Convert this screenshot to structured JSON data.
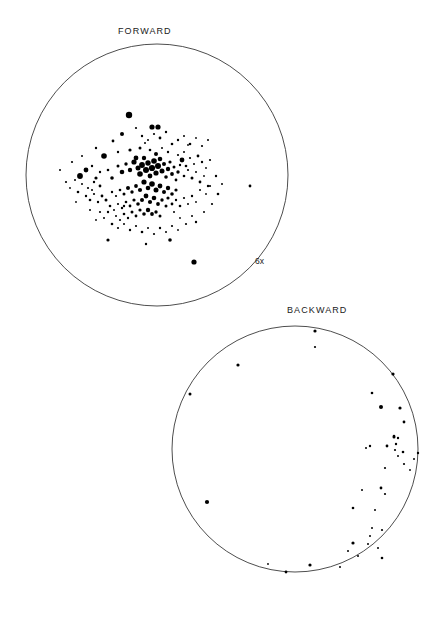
{
  "figure": {
    "title_forward": "FORWARD",
    "title_backward": "BACKWARD",
    "scale_annotation": "6x",
    "background_color": "#ffffff",
    "point_color": "#000000",
    "circle_stroke_color": "#3a3a3a"
  },
  "chart_data": [
    {
      "type": "scatter",
      "title": "FORWARD",
      "subtitle": "",
      "xlabel": "",
      "ylabel": "",
      "grid": false,
      "legend": null,
      "annotations": [
        "6x"
      ],
      "projection": "circular",
      "circle": {
        "cx": 157,
        "cy": 175,
        "r": 131
      },
      "xlim": [
        -1,
        1
      ],
      "ylim": [
        -1,
        1
      ],
      "n_points": 182,
      "points": [
        [
          129,
          115,
          3.2
        ],
        [
          122,
          134,
          2.0
        ],
        [
          113,
          141,
          1.4
        ],
        [
          136,
          128,
          1.1
        ],
        [
          152,
          127,
          2.6
        ],
        [
          158,
          127,
          2.6
        ],
        [
          104,
          156,
          2.8
        ],
        [
          96,
          148,
          1.2
        ],
        [
          118,
          152,
          1.2
        ],
        [
          130,
          150,
          1.6
        ],
        [
          140,
          148,
          1.5
        ],
        [
          145,
          143,
          1.0
        ],
        [
          150,
          150,
          1.3
        ],
        [
          156,
          154,
          2.0
        ],
        [
          162,
          148,
          1.0
        ],
        [
          168,
          152,
          1.2
        ],
        [
          172,
          144,
          1.3
        ],
        [
          178,
          155,
          1.1
        ],
        [
          184,
          152,
          1.0
        ],
        [
          188,
          145,
          0.9
        ],
        [
          86,
          170,
          2.4
        ],
        [
          92,
          166,
          1.2
        ],
        [
          80,
          176,
          2.9
        ],
        [
          75,
          180,
          1.0
        ],
        [
          96,
          178,
          1.6
        ],
        [
          100,
          172,
          1.2
        ],
        [
          108,
          170,
          1.3
        ],
        [
          112,
          178,
          1.8
        ],
        [
          118,
          166,
          1.5
        ],
        [
          122,
          172,
          2.3
        ],
        [
          126,
          164,
          1.7
        ],
        [
          130,
          170,
          2.2
        ],
        [
          134,
          162,
          2.6
        ],
        [
          136,
          158,
          2.4
        ],
        [
          138,
          168,
          2.5
        ],
        [
          140,
          174,
          2.8
        ],
        [
          142,
          165,
          2.9
        ],
        [
          144,
          158,
          2.2
        ],
        [
          146,
          170,
          3.0
        ],
        [
          148,
          163,
          2.7
        ],
        [
          150,
          176,
          2.4
        ],
        [
          152,
          168,
          3.1
        ],
        [
          154,
          161,
          2.8
        ],
        [
          156,
          173,
          2.6
        ],
        [
          158,
          166,
          3.0
        ],
        [
          160,
          159,
          2.3
        ],
        [
          162,
          171,
          2.5
        ],
        [
          164,
          164,
          2.0
        ],
        [
          166,
          177,
          1.8
        ],
        [
          168,
          169,
          2.2
        ],
        [
          170,
          162,
          1.6
        ],
        [
          172,
          174,
          1.9
        ],
        [
          174,
          167,
          1.5
        ],
        [
          176,
          180,
          1.4
        ],
        [
          178,
          172,
          1.7
        ],
        [
          180,
          165,
          1.2
        ],
        [
          184,
          176,
          1.3
        ],
        [
          188,
          170,
          1.1
        ],
        [
          192,
          178,
          1.5
        ],
        [
          196,
          172,
          1.0
        ],
        [
          200,
          182,
          1.4
        ],
        [
          204,
          176,
          0.9
        ],
        [
          208,
          186,
          1.2
        ],
        [
          144,
          182,
          2.6
        ],
        [
          148,
          188,
          2.3
        ],
        [
          152,
          184,
          2.8
        ],
        [
          156,
          190,
          2.5
        ],
        [
          160,
          186,
          2.4
        ],
        [
          164,
          192,
          2.0
        ],
        [
          168,
          188,
          2.2
        ],
        [
          172,
          194,
          1.8
        ],
        [
          176,
          190,
          1.6
        ],
        [
          140,
          190,
          2.1
        ],
        [
          136,
          186,
          1.9
        ],
        [
          132,
          192,
          1.7
        ],
        [
          128,
          188,
          2.0
        ],
        [
          124,
          194,
          1.5
        ],
        [
          120,
          190,
          1.3
        ],
        [
          116,
          196,
          1.1
        ],
        [
          112,
          192,
          1.2
        ],
        [
          146,
          196,
          2.4
        ],
        [
          150,
          202,
          2.1
        ],
        [
          154,
          198,
          2.3
        ],
        [
          158,
          204,
          1.9
        ],
        [
          162,
          200,
          1.7
        ],
        [
          166,
          206,
          1.5
        ],
        [
          142,
          200,
          2.0
        ],
        [
          138,
          204,
          1.8
        ],
        [
          134,
          200,
          1.6
        ],
        [
          130,
          206,
          1.4
        ],
        [
          126,
          202,
          1.3
        ],
        [
          122,
          208,
          1.2
        ],
        [
          118,
          204,
          1.1
        ],
        [
          114,
          210,
          1.0
        ],
        [
          110,
          206,
          1.3
        ],
        [
          106,
          200,
          1.5
        ],
        [
          102,
          196,
          1.4
        ],
        [
          98,
          202,
          1.2
        ],
        [
          94,
          194,
          1.1
        ],
        [
          90,
          200,
          1.3
        ],
        [
          148,
          210,
          2.2
        ],
        [
          152,
          214,
          1.9
        ],
        [
          156,
          212,
          1.7
        ],
        [
          160,
          216,
          1.5
        ],
        [
          144,
          214,
          1.8
        ],
        [
          140,
          210,
          1.6
        ],
        [
          136,
          216,
          1.4
        ],
        [
          132,
          212,
          1.5
        ],
        [
          128,
          218,
          1.2
        ],
        [
          124,
          214,
          1.3
        ],
        [
          120,
          220,
          1.1
        ],
        [
          116,
          216,
          1.0
        ],
        [
          168,
          198,
          1.6
        ],
        [
          172,
          204,
          1.4
        ],
        [
          176,
          200,
          1.2
        ],
        [
          180,
          206,
          1.3
        ],
        [
          184,
          198,
          1.1
        ],
        [
          188,
          204,
          1.0
        ],
        [
          192,
          196,
          1.2
        ],
        [
          196,
          202,
          0.9
        ],
        [
          182,
          160,
          2.4
        ],
        [
          186,
          166,
          1.3
        ],
        [
          190,
          158,
          1.1
        ],
        [
          194,
          164,
          1.0
        ],
        [
          198,
          156,
          1.4
        ],
        [
          202,
          162,
          1.2
        ],
        [
          206,
          168,
          0.9
        ],
        [
          210,
          160,
          1.1
        ],
        [
          178,
          140,
          1.2
        ],
        [
          184,
          136,
          1.0
        ],
        [
          190,
          144,
          1.3
        ],
        [
          196,
          138,
          0.9
        ],
        [
          202,
          146,
          1.1
        ],
        [
          208,
          140,
          1.0
        ],
        [
          166,
          132,
          1.2
        ],
        [
          160,
          138,
          1.4
        ],
        [
          154,
          134,
          1.1
        ],
        [
          148,
          140,
          1.0
        ],
        [
          142,
          136,
          1.2
        ],
        [
          100,
          186,
          1.4
        ],
        [
          94,
          182,
          1.2
        ],
        [
          88,
          188,
          1.1
        ],
        [
          82,
          184,
          1.0
        ],
        [
          78,
          192,
          1.3
        ],
        [
          86,
          196,
          1.2
        ],
        [
          92,
          190,
          1.0
        ],
        [
          70,
          188,
          0.9
        ],
        [
          66,
          182,
          1.1
        ],
        [
          108,
          212,
          1.2
        ],
        [
          104,
          218,
          1.0
        ],
        [
          100,
          212,
          1.1
        ],
        [
          96,
          220,
          0.9
        ],
        [
          112,
          224,
          1.3
        ],
        [
          118,
          228,
          1.1
        ],
        [
          124,
          224,
          1.0
        ],
        [
          130,
          230,
          1.2
        ],
        [
          136,
          226,
          1.1
        ],
        [
          142,
          232,
          1.3
        ],
        [
          148,
          228,
          1.0
        ],
        [
          154,
          234,
          1.1
        ],
        [
          160,
          228,
          1.2
        ],
        [
          166,
          232,
          1.0
        ],
        [
          172,
          226,
          1.1
        ],
        [
          178,
          230,
          0.9
        ],
        [
          108,
          240,
          1.6
        ],
        [
          146,
          244,
          1.2
        ],
        [
          170,
          240,
          1.8
        ],
        [
          196,
          222,
          1.2
        ],
        [
          204,
          212,
          1.0
        ],
        [
          212,
          204,
          1.1
        ],
        [
          218,
          194,
          1.3
        ],
        [
          222,
          184,
          1.0
        ],
        [
          216,
          176,
          1.2
        ],
        [
          210,
          186,
          1.1
        ],
        [
          206,
          194,
          0.9
        ],
        [
          200,
          190,
          1.0
        ],
        [
          192,
          216,
          1.0
        ],
        [
          186,
          224,
          1.1
        ],
        [
          180,
          218,
          0.9
        ],
        [
          174,
          212,
          1.0
        ],
        [
          194,
          262,
          2.6
        ],
        [
          124,
          206,
          1.2
        ],
        [
          250,
          186,
          1.4
        ],
        [
          60,
          170,
          1.0
        ],
        [
          72,
          162,
          1.1
        ],
        [
          82,
          156,
          1.0
        ],
        [
          90,
          210,
          1.0
        ],
        [
          76,
          202,
          0.9
        ]
      ]
    },
    {
      "type": "scatter",
      "title": "BACKWARD",
      "subtitle": "",
      "xlabel": "",
      "ylabel": "",
      "grid": false,
      "legend": null,
      "annotations": [],
      "projection": "circular",
      "circle": {
        "cx": 295,
        "cy": 449,
        "r": 123
      },
      "xlim": [
        -1,
        1
      ],
      "ylim": [
        -1,
        1
      ],
      "n_points": 44,
      "points": [
        [
          315,
          331,
          1.6
        ],
        [
          315,
          347,
          1.1
        ],
        [
          238,
          365,
          1.6
        ],
        [
          393,
          374,
          1.6
        ],
        [
          190,
          394,
          1.5
        ],
        [
          372,
          393,
          1.3
        ],
        [
          381,
          407,
          2.0
        ],
        [
          400,
          408,
          1.6
        ],
        [
          404,
          422,
          1.4
        ],
        [
          394,
          437,
          1.5
        ],
        [
          394,
          436,
          1.0
        ],
        [
          396,
          444,
          1.2
        ],
        [
          394,
          436,
          1.3
        ],
        [
          398,
          438,
          1.2
        ],
        [
          370,
          446,
          1.2
        ],
        [
          366,
          448,
          1.0
        ],
        [
          387,
          446,
          1.4
        ],
        [
          395,
          450,
          1.1
        ],
        [
          403,
          452,
          1.3
        ],
        [
          398,
          456,
          1.0
        ],
        [
          418,
          453,
          1.2
        ],
        [
          414,
          459,
          1.0
        ],
        [
          385,
          468,
          1.1
        ],
        [
          207,
          502,
          2.1
        ],
        [
          362,
          490,
          1.0
        ],
        [
          381,
          488,
          1.4
        ],
        [
          385,
          494,
          1.1
        ],
        [
          353,
          508,
          1.3
        ],
        [
          375,
          510,
          1.0
        ],
        [
          372,
          528,
          1.0
        ],
        [
          382,
          530,
          1.1
        ],
        [
          370,
          536,
          1.0
        ],
        [
          353,
          543,
          1.6
        ],
        [
          368,
          544,
          1.0
        ],
        [
          378,
          548,
          1.0
        ],
        [
          348,
          551,
          1.0
        ],
        [
          358,
          556,
          1.0
        ],
        [
          382,
          558,
          1.3
        ],
        [
          310,
          565,
          1.6
        ],
        [
          268,
          564,
          0.9
        ],
        [
          286,
          572,
          1.4
        ],
        [
          340,
          567,
          1.0
        ],
        [
          404,
          464,
          1.1
        ],
        [
          410,
          470,
          0.9
        ]
      ]
    }
  ]
}
